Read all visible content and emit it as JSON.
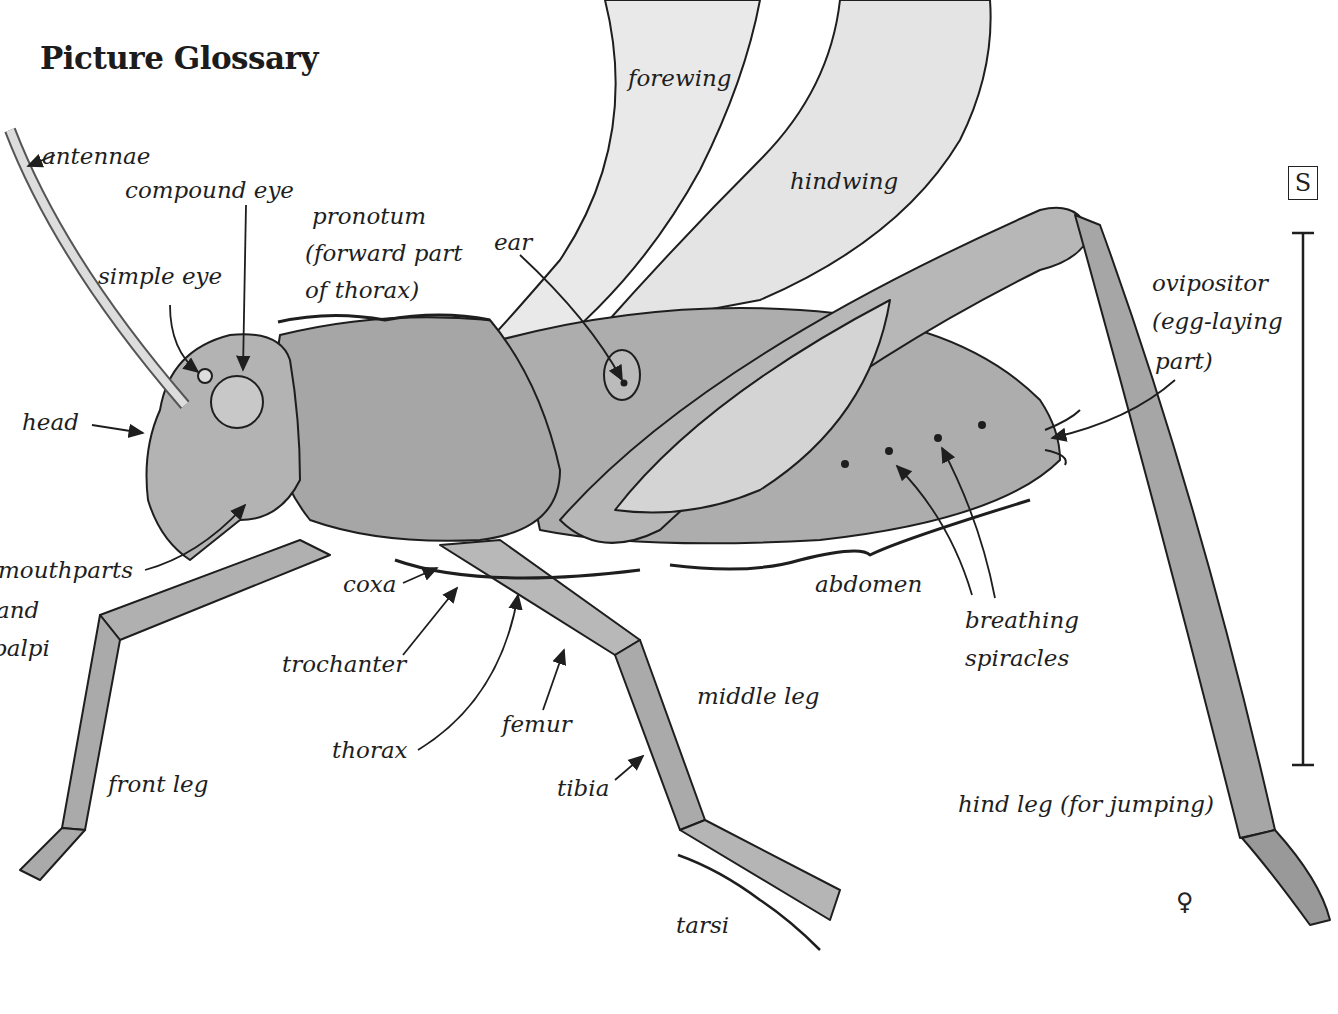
{
  "title": "Picture Glossary",
  "scale_marker": "S",
  "sex_symbol": "♀",
  "labels": {
    "antennae": "antennae",
    "compound_eye": "compound eye",
    "simple_eye": "simple eye",
    "pronotum_1": "pronotum",
    "pronotum_2": "(forward part",
    "pronotum_3": "of thorax)",
    "ear": "ear",
    "forewing": "forewing",
    "hindwing": "hindwing",
    "head": "head",
    "mouthparts_1": "mouthparts",
    "mouthparts_2": "and",
    "mouthparts_3": "palpi",
    "coxa": "coxa",
    "trochanter": "trochanter",
    "thorax": "thorax",
    "femur": "femur",
    "tibia": "tibia",
    "tarsi": "tarsi",
    "middle_leg": "middle leg",
    "front_leg": "front leg",
    "abdomen": "abdomen",
    "breathing_spiracles_1": "breathing",
    "breathing_spiracles_2": "spiracles",
    "ovipositor_1": "ovipositor",
    "ovipositor_2": "(egg-laying",
    "ovipositor_3": "part)",
    "hind_leg": "hind leg (for jumping)"
  },
  "colors": {
    "ink": "#1e1e1e",
    "body_gray": "#a9a9a9",
    "wing_gray": "#e6e6e6"
  }
}
